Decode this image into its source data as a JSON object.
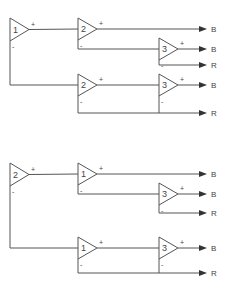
{
  "colors": {
    "line": "#555555",
    "arrow": "#333333",
    "text": "#444444",
    "background": "#ffffff"
  },
  "diagrams": [
    {
      "name": "top-tree",
      "amplifiers": [
        {
          "id": "a",
          "label": "1",
          "x": 10,
          "yTop": 18,
          "yBot": 41
        },
        {
          "id": "b",
          "label": "2",
          "x": 78,
          "yTop": 18,
          "yBot": 40
        },
        {
          "id": "c",
          "label": "3",
          "x": 159,
          "yTop": 38,
          "yBot": 60
        },
        {
          "id": "d",
          "label": "2",
          "x": 78,
          "yTop": 74,
          "yBot": 96
        },
        {
          "id": "e",
          "label": "3",
          "x": 159,
          "yTop": 74,
          "yBot": 96
        }
      ],
      "outputs": [
        {
          "y": 29,
          "label": "B"
        },
        {
          "y": 49,
          "label": "B"
        },
        {
          "y": 65,
          "label": "R"
        },
        {
          "y": 85,
          "label": "B"
        },
        {
          "y": 113,
          "label": "R"
        }
      ]
    },
    {
      "name": "bottom-tree",
      "amplifiers": [
        {
          "id": "a",
          "label": "2",
          "x": 10,
          "yTop": 163,
          "yBot": 186
        },
        {
          "id": "b",
          "label": "1",
          "x": 78,
          "yTop": 163,
          "yBot": 185
        },
        {
          "id": "c",
          "label": "3",
          "x": 159,
          "yTop": 183,
          "yBot": 205
        },
        {
          "id": "d",
          "label": "1",
          "x": 78,
          "yTop": 237,
          "yBot": 259
        },
        {
          "id": "e",
          "label": "3",
          "x": 159,
          "yTop": 237,
          "yBot": 259
        }
      ],
      "outputs": [
        {
          "y": 174,
          "label": "B"
        },
        {
          "y": 194,
          "label": "B"
        },
        {
          "y": 213,
          "label": "R"
        },
        {
          "y": 248,
          "label": "B"
        },
        {
          "y": 273,
          "label": "R"
        }
      ]
    }
  ],
  "signs": {
    "plus": "+",
    "minus": "-"
  }
}
